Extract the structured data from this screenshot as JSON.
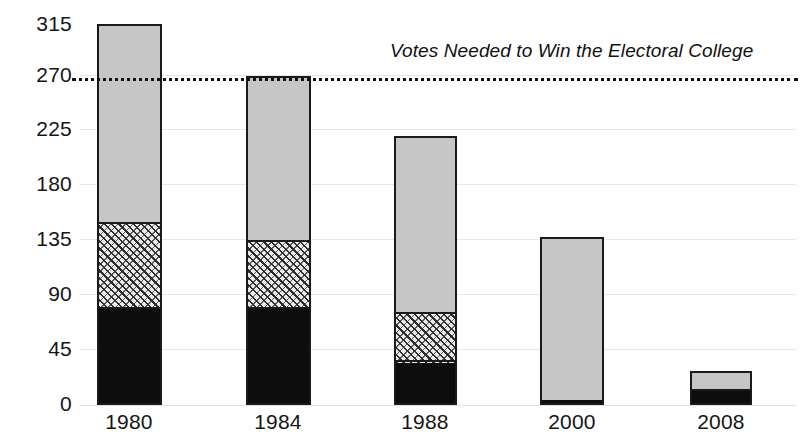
{
  "chart_data": {
    "type": "bar",
    "subtype": "stacked-bar",
    "title": "",
    "xlabel": "",
    "ylabel": "",
    "categories": [
      "1980",
      "1984",
      "1988",
      "2000",
      "2008"
    ],
    "ylim": [
      0,
      315
    ],
    "yticks": [
      0,
      45,
      90,
      135,
      180,
      225,
      270,
      315
    ],
    "grid": true,
    "legend": false,
    "series": [
      {
        "name": "solid-dark-segment",
        "color": "#0d0d0d",
        "values": [
          80,
          80,
          35,
          4,
          12
        ]
      },
      {
        "name": "hatched-segment",
        "color": "#e9e9e9",
        "values": [
          70,
          55,
          40,
          0,
          0
        ]
      },
      {
        "name": "light-gray-segment",
        "color": "#c6c6c6",
        "values": [
          165,
          137,
          147,
          135,
          16
        ]
      }
    ],
    "totals": [
      315,
      272,
      222,
      139,
      28
    ],
    "annotations": [
      {
        "name": "threshold-line",
        "value": 270,
        "style": "dotted",
        "label": "Votes Needed to Win the Electoral College"
      }
    ]
  },
  "axes": {
    "y_tick_labels": [
      "315",
      "270",
      "225",
      "180",
      "135",
      "90",
      "45",
      "0"
    ],
    "x_tick_labels": [
      "1980",
      "1984",
      "1988",
      "2000",
      "2008"
    ]
  },
  "annotation": {
    "threshold_text": "Votes Needed to Win the Electoral College"
  }
}
